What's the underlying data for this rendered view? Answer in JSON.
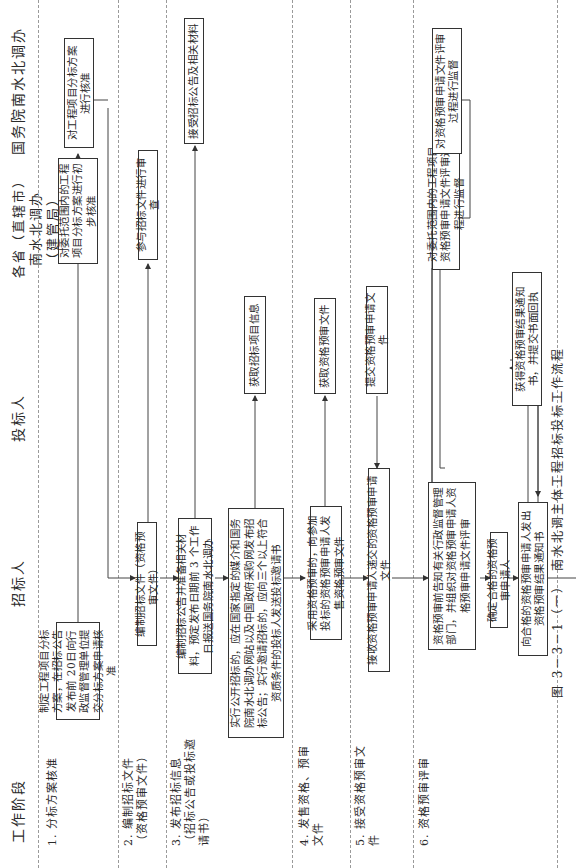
{
  "columns": {
    "stage": "工作阶段",
    "tenderer": "招标人",
    "bidder": "投标人",
    "province": [
      "各省（直辖市）",
      "南水北调办（建管局）"
    ],
    "state_office": "国务院南水北调办"
  },
  "stages": [
    "1. 分标方案核准",
    "2. 编制招标文件（资格预审文件）",
    "3. 发布招标信息（招标公告或投标邀请书）",
    "4. 发售资格、预审文件",
    "5. 接受资格预审文件",
    "6. 资格预审评审"
  ],
  "boxes": {
    "s1_tenderer": "制定工程项目分标方案，在招标公告发布前 20日向行政监督管理单位提交分标方案申请核准",
    "s1_province": "对委托范围内的工程项目分标方案进行初步核准",
    "s1_state": "对工程项目分标方案进行核准",
    "s2_tenderer": "编制招标文件（资格预审文件）",
    "s2_province": "参与招标文件进行审查",
    "s3a_tenderer": "编制招标公告并准备相关材料，预定发布日期前 3 个工作日报送国务院南水北调办",
    "s3_state": "接受招标公告及相关材料",
    "s3b_tenderer": "实行公开招标的，应在国家指定的媒介和国务院南水北调办网站以及中国政府采购网发布招标公告；实行邀请招标的，应向三个以上符合资质条件的投标人发送投标邀请书",
    "s3_bidder": "获取招标项目信息",
    "s4_tenderer": "采用资格预审的，向参加投标的资格预审申请人发售资格预审文件",
    "s4_bidder": "获取资格预审文件",
    "s5_bidder": "提交资格预审申请文件",
    "s5_tenderer": "接收资格预审申请人递交的资格预审申请文件",
    "s6a_tenderer": "资格预审前告知有关行政监督管理部门，并组织对资格预审申请人资格预审申请文件评审",
    "s6_province": "对委托范围内的工程项目资格预审申请文件评审过程进行监督",
    "s6_state": "对资格预审申请文件评审过程进行监督",
    "s6b_tenderer": "确定合格的资格预审申请人",
    "s6c_tenderer": "向合格的资格预审申请人发出资格预审结果通知书",
    "s6_bidder": "获得资格预审结果通知书，并提交书面回执"
  },
  "caption": "图 3－3－1（一）　南水北调主体工程招标投标工作流程"
}
